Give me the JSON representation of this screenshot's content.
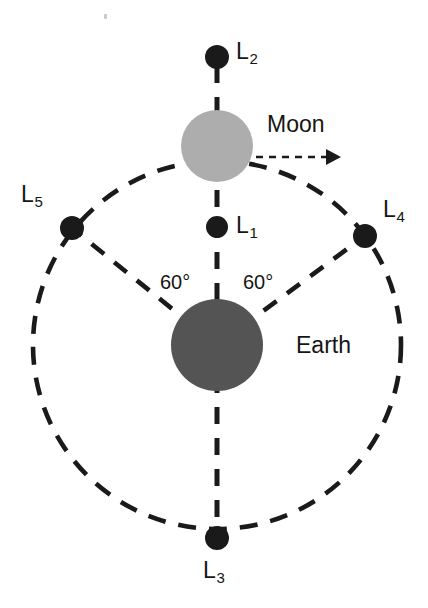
{
  "figure": {
    "background_color": "#ffffff",
    "stroke_color": "#1a1a1a",
    "width": 428,
    "height": 608
  },
  "bodies": [
    {
      "key": "earth",
      "label": "Earth",
      "color": "#545454",
      "cx": 217,
      "cy": 345,
      "r": 46,
      "label_x": 296,
      "label_y": 334
    },
    {
      "key": "moon",
      "label": "Moon",
      "color": "#adadad",
      "cx": 217,
      "cy": 146,
      "r": 36,
      "label_x": 267,
      "label_y": 113
    }
  ],
  "lagrange_points": [
    {
      "key": "L1",
      "label": "L",
      "sub": "1",
      "cx": 217,
      "cy": 227,
      "r": 11,
      "label_x": 236,
      "label_y": 214
    },
    {
      "key": "L2",
      "label": "L",
      "sub": "2",
      "cx": 217,
      "cy": 57,
      "r": 12,
      "label_x": 236,
      "label_y": 40
    },
    {
      "key": "L3",
      "label": "L",
      "sub": "3",
      "cx": 217,
      "cy": 538,
      "r": 12,
      "label_x": 203,
      "label_y": 559
    },
    {
      "key": "L4",
      "label": "L",
      "sub": "4",
      "cx": 365,
      "cy": 236,
      "r": 12,
      "label_x": 383,
      "label_y": 198
    },
    {
      "key": "L5",
      "label": "L",
      "sub": "5",
      "cx": 72,
      "cy": 228,
      "r": 12,
      "label_x": 21,
      "label_y": 183
    }
  ],
  "angles": [
    {
      "key": "angle-left",
      "label": "60°",
      "x": 160,
      "y": 272
    },
    {
      "key": "angle-right",
      "label": "60°",
      "x": 243,
      "y": 272
    }
  ],
  "orbit": {
    "label": "moon-orbit-circle",
    "cx": 217,
    "cy": 345,
    "r": 184,
    "dash": "18 13",
    "width": 4.6,
    "color": "#1a1a1a"
  },
  "axis_line": {
    "label": "earth-moon-axis",
    "x": 217,
    "y_top": 66,
    "y_bottom": 530,
    "dash": "17 14",
    "width": 5,
    "color": "#1a1a1a"
  },
  "radial_lines": [
    {
      "key": "earth-to-L5",
      "x1": 217,
      "y1": 345,
      "x2": 78,
      "y2": 233,
      "dash": "16 13",
      "width": 4.6
    },
    {
      "key": "earth-to-L4",
      "x1": 217,
      "y1": 345,
      "x2": 358,
      "y2": 241,
      "dash": "16 13",
      "width": 4.6
    }
  ],
  "velocity_arrow": {
    "key": "moon-velocity-arrow",
    "x1": 256,
    "y1": 157,
    "x2": 341,
    "y2": 157,
    "dash": "7 6",
    "width": 2.6,
    "color": "#1a1a1a"
  },
  "artifact": {
    "key": "scan-speck",
    "x": 104,
    "y": 14
  }
}
